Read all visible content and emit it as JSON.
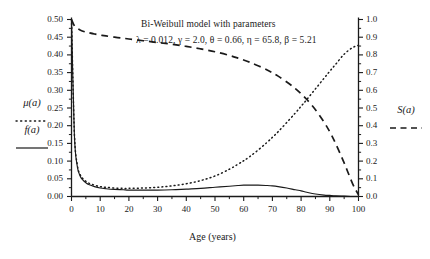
{
  "chart_data": {
    "type": "line",
    "title": "Bi-Weibull model with parameters",
    "subtitle": "λ = 0.012, γ = 2.0, θ = 0.66, η = 65.8, β = 5.21",
    "xlabel": "Age (years)",
    "ylabel_left": "μ(a)  f(a)",
    "ylabel_right": "S(a)",
    "xlim": [
      0,
      100
    ],
    "ylim_left": [
      0.0,
      0.5
    ],
    "ylim_right": [
      0.0,
      1.0
    ],
    "grid": false,
    "legend_position": "outside-left-and-right",
    "parameters": {
      "lambda": 0.012,
      "gamma": 2.0,
      "theta": 0.66,
      "eta": 65.8,
      "beta": 5.21
    },
    "xticks": [
      "0",
      "10",
      "20",
      "30",
      "40",
      "50",
      "60",
      "70",
      "80",
      "90",
      "100"
    ],
    "xtick_values": [
      0,
      10,
      20,
      30,
      40,
      50,
      60,
      70,
      80,
      90,
      100
    ],
    "yticks_left": [
      "0.00",
      "0.05",
      "0.10",
      "0.15",
      "0.20",
      "0.25",
      "0.30",
      "0.35",
      "0.40",
      "0.45",
      "0.50"
    ],
    "ytick_values_left": [
      0.0,
      0.05,
      0.1,
      0.15,
      0.2,
      0.25,
      0.3,
      0.35,
      0.4,
      0.45,
      0.5
    ],
    "yticks_right": [
      "0.0",
      "0.1",
      "0.2",
      "0.3",
      "0.4",
      "0.5",
      "0.6",
      "0.7",
      "0.8",
      "0.9",
      "1.0"
    ],
    "ytick_values_right": [
      0.0,
      0.1,
      0.2,
      0.3,
      0.4,
      0.5,
      0.6,
      0.7,
      0.8,
      0.9,
      1.0
    ],
    "x": [
      0,
      1,
      2,
      3,
      4,
      5,
      6,
      8,
      10,
      12,
      15,
      18,
      20,
      25,
      30,
      35,
      40,
      45,
      50,
      55,
      58,
      60,
      62,
      65,
      68,
      70,
      72,
      75,
      78,
      80,
      82,
      85,
      88,
      90,
      92,
      95,
      98,
      100
    ],
    "series": [
      {
        "name": "μ(a)",
        "style": "dotted",
        "axis": "left",
        "values": [
          0.5,
          0.18,
          0.09,
          0.062,
          0.05,
          0.043,
          0.038,
          0.032,
          0.028,
          0.026,
          0.024,
          0.023,
          0.023,
          0.024,
          0.026,
          0.03,
          0.036,
          0.045,
          0.058,
          0.077,
          0.091,
          0.101,
          0.112,
          0.131,
          0.152,
          0.167,
          0.183,
          0.209,
          0.236,
          0.255,
          0.274,
          0.304,
          0.334,
          0.354,
          0.373,
          0.402,
          0.421,
          0.427
        ]
      },
      {
        "name": "f(a)",
        "style": "solid",
        "axis": "left",
        "values": [
          0.5,
          0.175,
          0.086,
          0.058,
          0.046,
          0.039,
          0.034,
          0.028,
          0.024,
          0.022,
          0.02,
          0.019,
          0.018,
          0.018,
          0.018,
          0.019,
          0.021,
          0.023,
          0.026,
          0.029,
          0.031,
          0.032,
          0.032,
          0.032,
          0.031,
          0.03,
          0.028,
          0.024,
          0.019,
          0.016,
          0.012,
          0.007,
          0.004,
          0.003,
          0.002,
          0.001,
          0.0,
          0.0
        ]
      },
      {
        "name": "S(a)",
        "style": "dashed",
        "axis": "right",
        "values": [
          1.0,
          0.965,
          0.95,
          0.941,
          0.934,
          0.929,
          0.925,
          0.918,
          0.912,
          0.907,
          0.9,
          0.894,
          0.89,
          0.88,
          0.87,
          0.86,
          0.848,
          0.834,
          0.818,
          0.797,
          0.782,
          0.771,
          0.759,
          0.739,
          0.716,
          0.699,
          0.68,
          0.647,
          0.61,
          0.58,
          0.548,
          0.49,
          0.42,
          0.365,
          0.3,
          0.19,
          0.07,
          0.01
        ]
      }
    ]
  },
  "legends": {
    "left": [
      {
        "label": "μ(a)",
        "style": "dotted"
      },
      {
        "label": "f(a)",
        "style": "solid"
      }
    ],
    "right": [
      {
        "label": "S(a)",
        "style": "dashed"
      }
    ]
  }
}
